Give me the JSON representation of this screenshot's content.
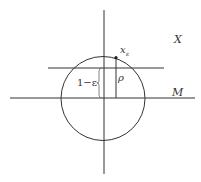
{
  "diagram": {
    "labels": {
      "space": "X",
      "subspace": "M",
      "point": "x",
      "point_sub": "ε",
      "radius": "ρ",
      "distance": "1−ε"
    },
    "colors": {
      "stroke": "#333333",
      "background": "#ffffff"
    }
  }
}
